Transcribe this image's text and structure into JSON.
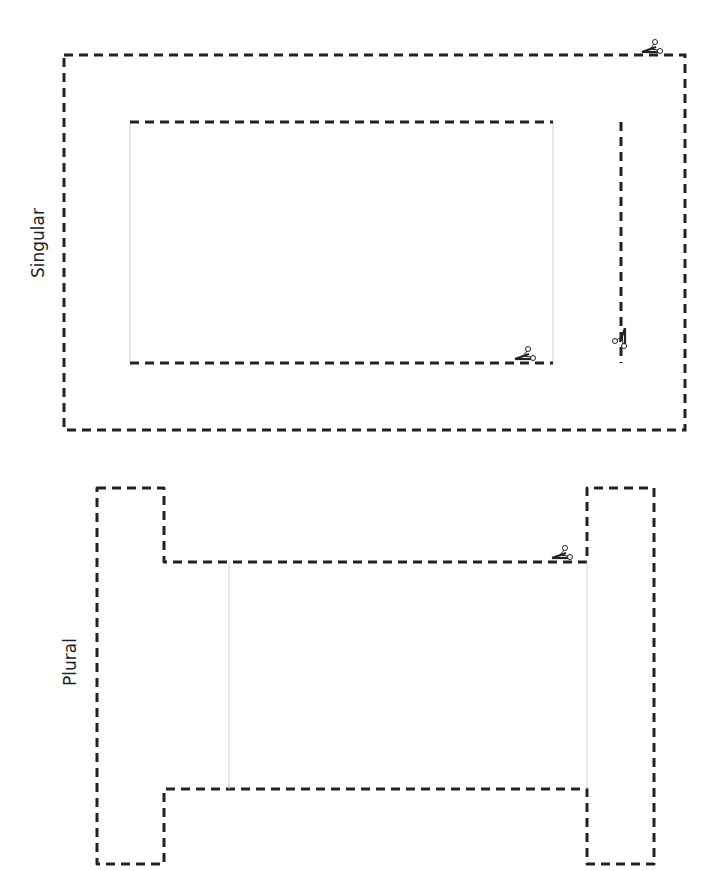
{
  "sections": {
    "singular": {
      "label": "Singular"
    },
    "plural": {
      "label": "Plural"
    }
  },
  "colors": {
    "cut_line": "#222222",
    "fold_line": "#cfcfcf",
    "background": "#ffffff"
  },
  "icons": {
    "scissors": "scissors-icon"
  }
}
